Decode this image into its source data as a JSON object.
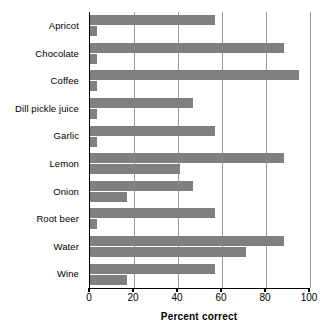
{
  "chart_data": {
    "type": "bar",
    "orientation": "horizontal",
    "title": "",
    "subtitle": "",
    "xlabel": "Percent correct",
    "ylabel": "",
    "xlim": [
      0,
      100
    ],
    "xticks": [
      0,
      20,
      40,
      60,
      80,
      100
    ],
    "xtick_labels": [
      "0",
      "20",
      "40",
      "60",
      "80",
      "100"
    ],
    "grid": true,
    "grid_axis": "x",
    "legend": false,
    "legend_position": "none",
    "bar_color": "#808080",
    "axis_color": "#000000",
    "gridline_color": "#9a9a9a",
    "background": "#ffffff",
    "categories": [
      "Apricot",
      "Chocolate",
      "Coffee",
      "Dill pickle juice",
      "Garlic",
      "Lemon",
      "Onion",
      "Root beer",
      "Water",
      "Wine"
    ],
    "series": [
      {
        "name": "",
        "values": [
          57,
          88,
          95,
          47,
          57,
          88,
          47,
          57,
          88,
          57
        ]
      },
      {
        "name": "",
        "values": [
          3,
          3,
          3,
          3,
          3,
          41,
          17,
          3,
          71,
          17
        ]
      }
    ]
  }
}
